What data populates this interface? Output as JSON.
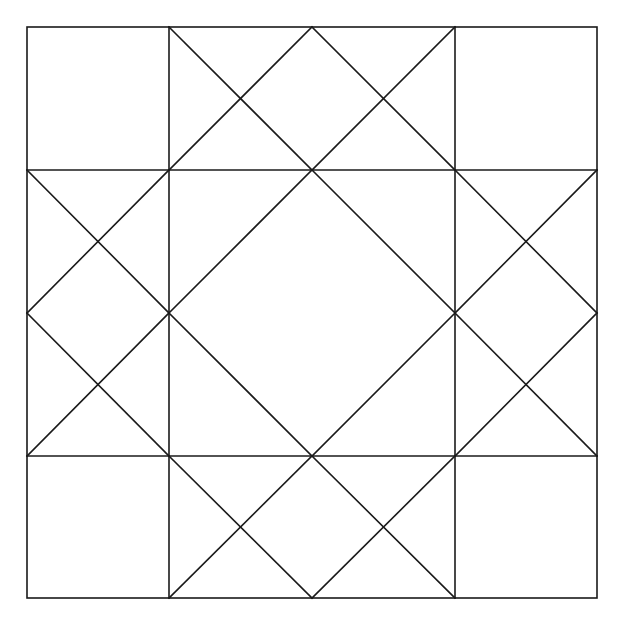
{
  "diagram": {
    "title": "",
    "type": "quilt-block-pattern",
    "grid": {
      "rows": 4,
      "cols": 4
    },
    "colors": {
      "stroke": "#1a1a1a",
      "background": "#ffffff"
    }
  }
}
